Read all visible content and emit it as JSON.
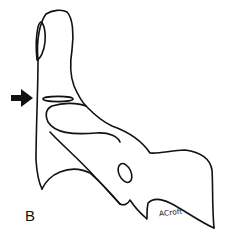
{
  "figure": {
    "panel_label": "B",
    "signature": "ACroft",
    "annotation": "arrow-pointing-right",
    "colors": {
      "line": "#111111",
      "background": "#ffffff"
    }
  }
}
